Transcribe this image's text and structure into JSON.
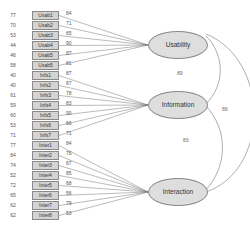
{
  "latents": [
    {
      "name": "Usability",
      "x": 148,
      "y": 31
    },
    {
      "name": "Information",
      "x": 148,
      "y": 91
    },
    {
      "name": "Interaction",
      "x": 148,
      "y": 178
    }
  ],
  "indicators": [
    {
      "label": "Usab1",
      "error": "77",
      "loading": "84",
      "factor": 0
    },
    {
      "label": "Usab2",
      "error": "70",
      "loading": "71",
      "factor": 0
    },
    {
      "label": "Usab3",
      "error": "53",
      "loading": "65",
      "factor": 0
    },
    {
      "label": "Usab4",
      "error": "44",
      "loading": "90",
      "factor": 0
    },
    {
      "label": "Usab5",
      "error": "46",
      "loading": "87",
      "factor": 0
    },
    {
      "label": "Usab5",
      "error": "58",
      "loading": "81",
      "factor": 0
    },
    {
      "label": "Infs1",
      "error": "40",
      "loading": "87",
      "factor": 1
    },
    {
      "label": "Infs2",
      "error": "40",
      "loading": "67",
      "factor": 1
    },
    {
      "label": "Infs3",
      "error": "61",
      "loading": "78",
      "factor": 1
    },
    {
      "label": "Infs4",
      "error": "59",
      "loading": "83",
      "factor": 1
    },
    {
      "label": "Infs5",
      "error": "60",
      "loading": "90",
      "factor": 1
    },
    {
      "label": "Infs6",
      "error": "53",
      "loading": "66",
      "factor": 1
    },
    {
      "label": "Infs7",
      "error": "71",
      "loading": "71",
      "factor": 1
    },
    {
      "label": "Inter1",
      "error": "77",
      "loading": "84",
      "factor": 2
    },
    {
      "label": "Inter2",
      "error": "84",
      "loading": "76",
      "factor": 2
    },
    {
      "label": "Inter3",
      "error": "74",
      "loading": "67",
      "factor": 2
    },
    {
      "label": "Inter4",
      "error": "52",
      "loading": "85",
      "factor": 2
    },
    {
      "label": "Inter5",
      "error": "72",
      "loading": "68",
      "factor": 2
    },
    {
      "label": "Inter6",
      "error": "65",
      "loading": "56",
      "factor": 2
    },
    {
      "label": "Inter7",
      "error": "62",
      "loading": "79",
      "factor": 2
    },
    {
      "label": "Inter8",
      "error": "62",
      "loading": "53",
      "factor": 2
    }
  ],
  "correlations": [
    {
      "between": [
        "Usability",
        "Information"
      ],
      "value": "89"
    },
    {
      "between": [
        "Information",
        "Interaction"
      ],
      "value": "83"
    },
    {
      "between": [
        "Usability",
        "Interaction"
      ],
      "value": "89"
    }
  ]
}
